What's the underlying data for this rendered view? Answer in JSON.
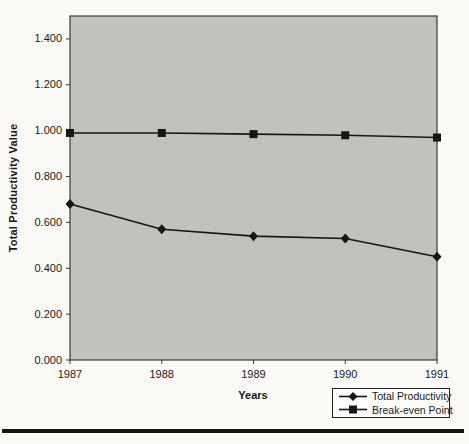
{
  "chart_data": {
    "type": "line",
    "title": "",
    "xlabel": "Years",
    "ylabel": "Total Productivity Value",
    "categories": [
      "1987",
      "1988",
      "1989",
      "1990",
      "1991"
    ],
    "series": [
      {
        "name": "Total Productivity",
        "marker": "diamond",
        "values": [
          0.68,
          0.57,
          0.54,
          0.53,
          0.45
        ]
      },
      {
        "name": "Break-even Point",
        "marker": "square",
        "values": [
          0.99,
          0.99,
          0.985,
          0.98,
          0.97
        ]
      }
    ],
    "ylim": [
      0,
      1.5
    ],
    "ytick_values": [
      0,
      0.2,
      0.4,
      0.6,
      0.8,
      1.0,
      1.2,
      1.4
    ],
    "ytick_labels": [
      "0.000",
      "0.200",
      "0.400",
      "0.600",
      "0.800",
      "1.000",
      "1.200",
      "1.400"
    ],
    "grid": false,
    "legend_position": "bottom-right",
    "colors": {
      "plot_background": "#c2c1be",
      "line": "#161616",
      "marker": "#161616",
      "plot_border": "#3a3a3a"
    }
  }
}
